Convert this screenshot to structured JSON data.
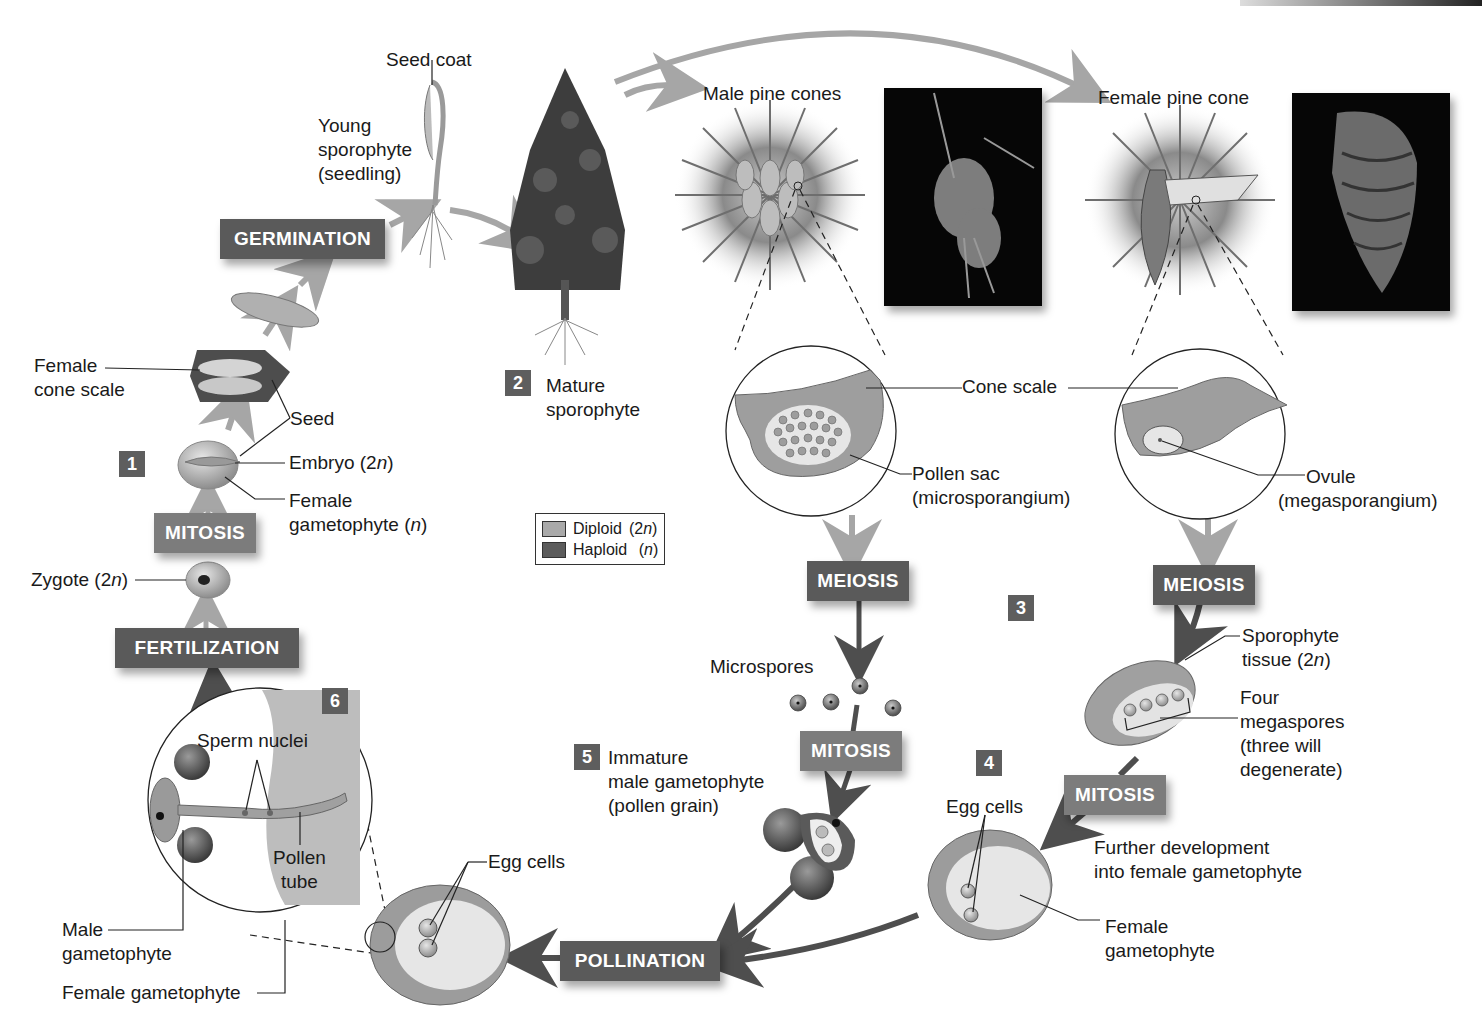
{
  "diagram": {
    "type": "life-cycle",
    "colors": {
      "process_box_dark": "#5a5a5a",
      "process_box_light": "#7c7c7c",
      "step_badge": "#5e5e5e",
      "diploid_swatch": "#a9a9a9",
      "haploid_swatch": "#5c5c5c",
      "arrow_diploid": "#a6a6a6",
      "arrow_haploid": "#4e4e4e"
    }
  },
  "legend": {
    "items": [
      {
        "label": "Diploid",
        "ploidy": "(2n)",
        "ploidy_base": "(2",
        "ploidy_var": "n",
        "ploidy_close": ")"
      },
      {
        "label": "Haploid",
        "ploidy": "(n)",
        "ploidy_base": "(",
        "ploidy_var": "n",
        "ploidy_close": ")"
      }
    ]
  },
  "processes": {
    "germination": "GERMINATION",
    "mitosis_seed": "MITOSIS",
    "fertilization": "FERTILIZATION",
    "meiosis_male": "MEIOSIS",
    "meiosis_female": "MEIOSIS",
    "mitosis_male": "MITOSIS",
    "mitosis_female": "MITOSIS",
    "pollination": "POLLINATION"
  },
  "steps": [
    "1",
    "2",
    "3",
    "4",
    "5",
    "6"
  ],
  "labels": {
    "seed_coat": "Seed coat",
    "young_sporophyte": [
      "Young",
      "sporophyte",
      "(seedling)"
    ],
    "female_cone_scale": [
      "Female",
      "cone scale"
    ],
    "seed": "Seed",
    "embryo": {
      "text": "Embryo (2",
      "var": "n",
      "close": ")"
    },
    "female_gametophyte_seed": {
      "line1": "Female",
      "line2": "gametophyte (",
      "var": "n",
      "close": ")"
    },
    "zygote": {
      "text": "Zygote (2",
      "var": "n",
      "close": ")"
    },
    "mature_sporophyte": [
      "Mature",
      "sporophyte"
    ],
    "male_pine_cones": "Male pine cones",
    "female_pine_cone": "Female pine cone",
    "cone_scale": "Cone scale",
    "pollen_sac": [
      "Pollen sac",
      "(microsporangium)"
    ],
    "ovule": [
      "Ovule",
      "(megasporangium)"
    ],
    "microspores": "Microspores",
    "sporophyte_tissue": {
      "line1": "Sporophyte",
      "line2": "tissue (2",
      "var": "n",
      "close": ")"
    },
    "four_megaspores": [
      "Four",
      "megaspores",
      "(three will",
      "degenerate)"
    ],
    "immature_male_gametophyte": [
      "Immature",
      "male gametophyte",
      "(pollen grain)"
    ],
    "egg_cells_right": "Egg cells",
    "further_development": [
      "Further development",
      "into female gametophyte"
    ],
    "female_gametophyte_right": [
      "Female",
      "gametophyte"
    ],
    "egg_cells_bottom": "Egg cells",
    "sperm_nuclei": "Sperm nuclei",
    "pollen_tube": [
      "Pollen",
      "tube"
    ],
    "male_gametophyte": [
      "Male",
      "gametophyte"
    ],
    "female_gametophyte_bottom": "Female gametophyte"
  }
}
